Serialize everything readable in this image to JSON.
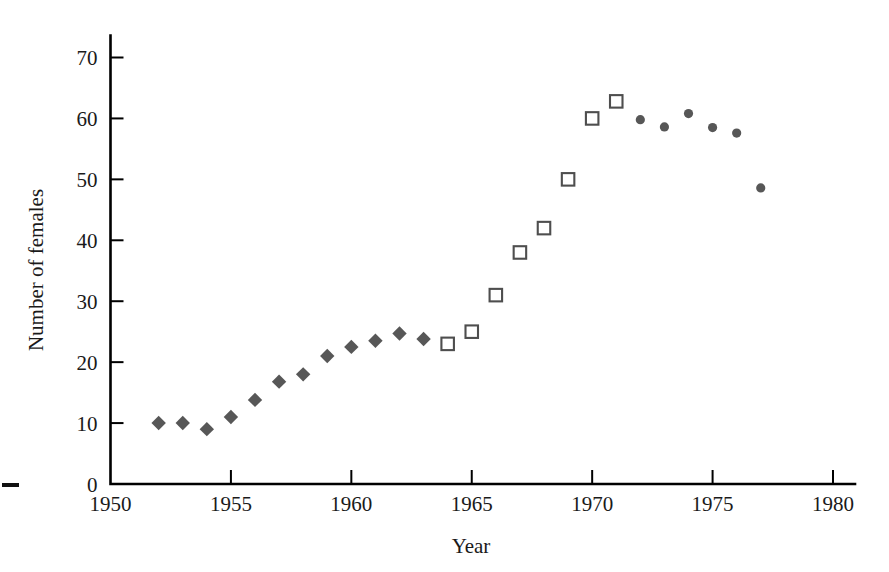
{
  "chart_data": {
    "type": "scatter",
    "title": "",
    "xlabel": "Year",
    "ylabel": "Number of females",
    "xlim": [
      1950,
      1980
    ],
    "ylim": [
      0,
      72
    ],
    "grid": false,
    "legend": "none",
    "x_ticks": [
      1950,
      1955,
      1960,
      1965,
      1970,
      1975,
      1980
    ],
    "x_tick_labels": [
      "1950",
      "1955",
      "1960",
      "1965",
      "1970",
      "1975",
      "1980"
    ],
    "y_ticks": [
      0,
      10,
      20,
      30,
      40,
      50,
      60,
      70
    ],
    "y_tick_labels": [
      "0",
      "10",
      "20",
      "30",
      "40",
      "50",
      "60",
      "70"
    ],
    "series": [
      {
        "name": "diamond-period",
        "marker": "diamond",
        "color": "#575757",
        "filled": true,
        "points": [
          {
            "x": 1952,
            "y": 10.0
          },
          {
            "x": 1953,
            "y": 10.0
          },
          {
            "x": 1954,
            "y": 9.0
          },
          {
            "x": 1955,
            "y": 11.0
          },
          {
            "x": 1956,
            "y": 13.8
          },
          {
            "x": 1957,
            "y": 16.8
          },
          {
            "x": 1958,
            "y": 18.0
          },
          {
            "x": 1959,
            "y": 21.0
          },
          {
            "x": 1960,
            "y": 22.5
          },
          {
            "x": 1961,
            "y": 23.5
          },
          {
            "x": 1962,
            "y": 24.7
          },
          {
            "x": 1963,
            "y": 23.8
          }
        ]
      },
      {
        "name": "square-period",
        "marker": "square",
        "color": "#4e4e4e",
        "filled": false,
        "points": [
          {
            "x": 1964,
            "y": 23.0
          },
          {
            "x": 1965,
            "y": 25.0
          },
          {
            "x": 1966,
            "y": 31.0
          },
          {
            "x": 1967,
            "y": 38.0
          },
          {
            "x": 1968,
            "y": 42.0
          },
          {
            "x": 1969,
            "y": 50.0
          },
          {
            "x": 1970,
            "y": 60.0
          },
          {
            "x": 1971,
            "y": 62.8
          }
        ]
      },
      {
        "name": "circle-period",
        "marker": "circle",
        "color": "#575757",
        "filled": true,
        "points": [
          {
            "x": 1972,
            "y": 59.8
          },
          {
            "x": 1973,
            "y": 58.6
          },
          {
            "x": 1974,
            "y": 60.8
          },
          {
            "x": 1975,
            "y": 58.5
          },
          {
            "x": 1976,
            "y": 57.6
          },
          {
            "x": 1977,
            "y": 48.6
          }
        ]
      }
    ]
  }
}
